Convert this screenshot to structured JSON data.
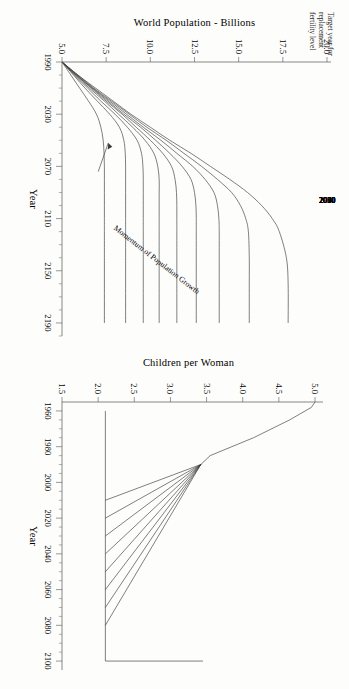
{
  "figure": {
    "background": "#fdfdfc",
    "ink": "#3b3b3b",
    "orientation_note": "page rotated 90 degrees"
  },
  "chart_data": [
    {
      "id": "world-population",
      "type": "line",
      "title": "",
      "xlabel": "Year",
      "ylabel": "World Population - Billions",
      "xlim": [
        1990,
        2200
      ],
      "ylim": [
        5.0,
        20.0
      ],
      "xticks": [
        1990,
        2030,
        2070,
        2110,
        2150,
        2190
      ],
      "xtick_labels": [
        "1990",
        "2030",
        "2070",
        "2110",
        "2150",
        "2190"
      ],
      "yticks": [
        5.0,
        7.5,
        10.0,
        12.5,
        15.0,
        17.5,
        20.0
      ],
      "ytick_labels": [
        "5.0",
        "7.5",
        "10.0",
        "12.5",
        "15.0",
        "17.5",
        "20.0"
      ],
      "grid": false,
      "legend_position": "curve-end-labels",
      "legend_title": "Target year for replacement fertility level",
      "annotations": [
        {
          "text": "Momentum of Population Growth",
          "points_to_series": "1991"
        }
      ],
      "series": [
        {
          "name": "2080",
          "label": "2080",
          "plateau": 17.8,
          "x": [
            1990,
            2000,
            2010,
            2020,
            2030,
            2040,
            2050,
            2060,
            2070,
            2080,
            2090,
            2100,
            2110,
            2120,
            2140,
            2160,
            2190
          ],
          "values": [
            5.0,
            5.9,
            6.9,
            7.9,
            8.9,
            10.0,
            11.1,
            12.3,
            13.4,
            14.5,
            15.5,
            16.3,
            16.9,
            17.3,
            17.7,
            17.8,
            17.8
          ]
        },
        {
          "name": "2070",
          "label": "2070",
          "plateau": 15.6,
          "x": [
            1990,
            2000,
            2010,
            2020,
            2030,
            2040,
            2050,
            2060,
            2070,
            2080,
            2090,
            2100,
            2110,
            2120,
            2140,
            2160,
            2190
          ],
          "values": [
            5.0,
            5.9,
            6.8,
            7.8,
            8.8,
            9.8,
            10.9,
            11.9,
            12.9,
            13.8,
            14.6,
            15.1,
            15.4,
            15.55,
            15.6,
            15.6,
            15.6
          ]
        },
        {
          "name": "2060",
          "label": "2060",
          "plateau": 13.9,
          "x": [
            1990,
            2000,
            2010,
            2020,
            2030,
            2040,
            2050,
            2060,
            2070,
            2080,
            2090,
            2100,
            2110,
            2120,
            2140,
            2160,
            2190
          ],
          "values": [
            5.0,
            5.85,
            6.75,
            7.7,
            8.65,
            9.6,
            10.6,
            11.5,
            12.4,
            13.1,
            13.6,
            13.8,
            13.88,
            13.9,
            13.9,
            13.9,
            13.9
          ]
        },
        {
          "name": "2050",
          "label": "2050",
          "plateau": 12.6,
          "x": [
            1990,
            2000,
            2010,
            2020,
            2030,
            2040,
            2050,
            2060,
            2070,
            2080,
            2090,
            2100,
            2110,
            2120,
            2140,
            2160,
            2190
          ],
          "values": [
            5.0,
            5.8,
            6.7,
            7.6,
            8.5,
            9.45,
            10.3,
            11.1,
            11.8,
            12.3,
            12.5,
            12.58,
            12.6,
            12.6,
            12.6,
            12.6,
            12.6
          ]
        },
        {
          "name": "2040",
          "label": "2040",
          "plateau": 11.5,
          "x": [
            1990,
            2000,
            2010,
            2020,
            2030,
            2040,
            2050,
            2060,
            2070,
            2080,
            2090,
            2100,
            2110,
            2120,
            2140,
            2160,
            2190
          ],
          "values": [
            5.0,
            5.8,
            6.65,
            7.5,
            8.4,
            9.2,
            10.0,
            10.7,
            11.2,
            11.4,
            11.48,
            11.5,
            11.5,
            11.5,
            11.5,
            11.5,
            11.5
          ]
        },
        {
          "name": "2030",
          "label": "2030",
          "plateau": 10.5,
          "x": [
            1990,
            2000,
            2010,
            2020,
            2030,
            2040,
            2050,
            2060,
            2070,
            2080,
            2090,
            2100,
            2110,
            2120,
            2140,
            2160,
            2190
          ],
          "values": [
            5.0,
            5.75,
            6.55,
            7.4,
            8.2,
            9.0,
            9.7,
            10.2,
            10.42,
            10.5,
            10.5,
            10.5,
            10.5,
            10.5,
            10.5,
            10.5,
            10.5
          ]
        },
        {
          "name": "2020",
          "label": "2020",
          "plateau": 9.6,
          "x": [
            1990,
            2000,
            2010,
            2020,
            2030,
            2040,
            2050,
            2060,
            2070,
            2080,
            2090,
            2100,
            2110,
            2120,
            2140,
            2160,
            2190
          ],
          "values": [
            5.0,
            5.7,
            6.45,
            7.2,
            8.0,
            8.7,
            9.25,
            9.5,
            9.58,
            9.6,
            9.6,
            9.6,
            9.6,
            9.6,
            9.6,
            9.6,
            9.6
          ]
        },
        {
          "name": "2010",
          "label": "2010",
          "plateau": 8.6,
          "x": [
            1990,
            2000,
            2010,
            2020,
            2030,
            2040,
            2050,
            2060,
            2070,
            2080,
            2090,
            2100,
            2110,
            2120,
            2140,
            2160,
            2190
          ],
          "values": [
            5.0,
            5.65,
            6.3,
            7.0,
            7.7,
            8.25,
            8.5,
            8.58,
            8.6,
            8.6,
            8.6,
            8.6,
            8.6,
            8.6,
            8.6,
            8.6,
            8.6
          ]
        },
        {
          "name": "1991",
          "label": "1991",
          "plateau": 7.4,
          "x": [
            1990,
            2000,
            2010,
            2020,
            2030,
            2040,
            2050,
            2060,
            2070,
            2080,
            2090,
            2100,
            2110,
            2120,
            2140,
            2160,
            2190
          ],
          "values": [
            5.0,
            5.5,
            6.0,
            6.5,
            6.95,
            7.2,
            7.33,
            7.38,
            7.4,
            7.4,
            7.4,
            7.4,
            7.4,
            7.4,
            7.4,
            7.4,
            7.4
          ]
        }
      ]
    },
    {
      "id": "children-per-woman",
      "type": "line",
      "title": "",
      "xlabel": "Year",
      "ylabel": "Children per Woman",
      "xlim": [
        1955,
        2105
      ],
      "ylim": [
        1.5,
        5.0
      ],
      "xticks": [
        1960,
        1980,
        2000,
        2020,
        2040,
        2060,
        2080,
        2100
      ],
      "xtick_labels": [
        "1960",
        "1980",
        "2000",
        "2020",
        "2040",
        "2060",
        "2080",
        "2100"
      ],
      "yticks": [
        1.5,
        2.0,
        2.5,
        3.0,
        3.5,
        4.0,
        4.5,
        5.0
      ],
      "ytick_labels": [
        "1.5",
        "2.0",
        "2.5",
        "3.0",
        "3.5",
        "4.0",
        "4.5",
        "5.0"
      ],
      "grid": false,
      "legend_position": "none",
      "replacement_level": 2.1,
      "history": {
        "name": "historical",
        "x": [
          1955,
          1958,
          1965,
          1975,
          1985,
          1990
        ],
        "values": [
          5.0,
          4.95,
          4.65,
          4.15,
          3.55,
          3.42
        ]
      },
      "series": [
        {
          "name": "2010",
          "target_year": 2010,
          "x": [
            1990,
            2010
          ],
          "values": [
            3.42,
            2.1
          ]
        },
        {
          "name": "2020",
          "target_year": 2020,
          "x": [
            1990,
            2020
          ],
          "values": [
            3.42,
            2.1
          ]
        },
        {
          "name": "2030",
          "target_year": 2030,
          "x": [
            1990,
            2030
          ],
          "values": [
            3.42,
            2.1
          ]
        },
        {
          "name": "2040",
          "target_year": 2040,
          "x": [
            1990,
            2040
          ],
          "values": [
            3.42,
            2.1
          ]
        },
        {
          "name": "2050",
          "target_year": 2050,
          "x": [
            1990,
            2050
          ],
          "values": [
            3.42,
            2.1
          ]
        },
        {
          "name": "2060",
          "target_year": 2060,
          "x": [
            1990,
            2060
          ],
          "values": [
            3.42,
            2.1
          ]
        },
        {
          "name": "2070",
          "target_year": 2070,
          "x": [
            1990,
            2070
          ],
          "values": [
            3.42,
            2.1
          ]
        },
        {
          "name": "2080",
          "target_year": 2080,
          "x": [
            1990,
            2080
          ],
          "values": [
            3.42,
            2.1
          ]
        }
      ]
    }
  ],
  "pop_chart": {
    "ylabel": "World Population - Billions",
    "xlabel": "Year",
    "legend_title_line1": "Target year for",
    "legend_title_line2": "replacement",
    "legend_title_line3": "fertility level",
    "annotation": "Momentum of Population Growth",
    "xtick_labels": [
      "1990",
      "2030",
      "2070",
      "2110",
      "2150",
      "2190"
    ],
    "ytick_labels": [
      "5.0",
      "7.5",
      "10.0",
      "12.5",
      "15.0",
      "17.5",
      "20.0"
    ],
    "curve_labels": [
      "2080",
      "2070",
      "2060",
      "2050",
      "2040",
      "2030",
      "2020",
      "2010",
      "1991"
    ]
  },
  "tfr_chart": {
    "ylabel": "Children per Woman",
    "xlabel": "Year",
    "xtick_labels": [
      "1960",
      "1980",
      "2000",
      "2020",
      "2040",
      "2060",
      "2080",
      "2100"
    ],
    "ytick_labels": [
      "1.5",
      "2.0",
      "2.5",
      "3.0",
      "3.5",
      "4.0",
      "4.5",
      "5.0"
    ]
  }
}
